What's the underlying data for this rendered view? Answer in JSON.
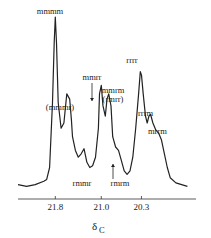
{
  "chart_data": {
    "type": "line",
    "title": "",
    "xlabel": "δ",
    "xlabel_sub": "C",
    "ylabel": "",
    "x_reversed": true,
    "xlim": [
      22.45,
      19.35
    ],
    "ylim": [
      0,
      1
    ],
    "grid": false,
    "xticks": [
      21.8,
      21.0,
      20.3
    ],
    "xtick_labels": [
      "21.8",
      "21.0",
      "20.3"
    ],
    "spectrum": {
      "x": [
        22.45,
        22.3,
        22.15,
        22.0,
        21.95,
        21.9,
        21.85,
        21.82,
        21.8,
        21.78,
        21.75,
        21.7,
        21.65,
        21.6,
        21.55,
        21.52,
        21.5,
        21.45,
        21.4,
        21.35,
        21.3,
        21.25,
        21.2,
        21.15,
        21.1,
        21.05,
        21.03,
        21.0,
        20.97,
        20.93,
        20.9,
        20.87,
        20.83,
        20.8,
        20.75,
        20.7,
        20.65,
        20.6,
        20.55,
        20.5,
        20.45,
        20.4,
        20.35,
        20.32,
        20.3,
        20.27,
        20.23,
        20.2,
        20.17,
        20.14,
        20.1,
        20.05,
        20.0,
        19.95,
        19.9,
        19.85,
        19.8,
        19.7,
        19.6,
        19.5
      ],
      "y": [
        0.02,
        0.01,
        0.02,
        0.04,
        0.05,
        0.12,
        0.5,
        0.85,
        1.0,
        0.85,
        0.5,
        0.35,
        0.38,
        0.55,
        0.52,
        0.4,
        0.3,
        0.22,
        0.18,
        0.2,
        0.23,
        0.15,
        0.12,
        0.13,
        0.18,
        0.35,
        0.55,
        0.6,
        0.48,
        0.42,
        0.52,
        0.55,
        0.48,
        0.3,
        0.24,
        0.22,
        0.16,
        0.1,
        0.08,
        0.1,
        0.18,
        0.35,
        0.55,
        0.68,
        0.66,
        0.55,
        0.42,
        0.38,
        0.42,
        0.43,
        0.38,
        0.34,
        0.32,
        0.28,
        0.2,
        0.12,
        0.06,
        0.03,
        0.02,
        0.01
      ]
    },
    "annotations": [
      {
        "text": "mmmm",
        "x": 21.8,
        "arrow": false
      },
      {
        "text": "(mmmr)",
        "x": 21.55,
        "arrow": false
      },
      {
        "text": "mmrr",
        "x": 21.0,
        "arrow": true
      },
      {
        "text": "mmrm",
        "x": 20.85,
        "arrow": false
      },
      {
        "text": "(rmrr)",
        "x": 20.85,
        "arrow": false
      },
      {
        "text": "rrrr",
        "x": 20.32,
        "arrow": false
      },
      {
        "text": "rrrm",
        "x": 20.14,
        "arrow": false
      },
      {
        "text": "mrrm",
        "x": 19.95,
        "arrow": false
      },
      {
        "text": "rmmr",
        "x": 21.3,
        "arrow": false
      },
      {
        "text": "rmrm",
        "x": 20.75,
        "arrow": true
      }
    ]
  }
}
